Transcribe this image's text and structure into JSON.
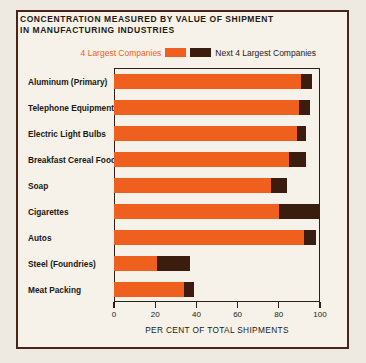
{
  "title": {
    "line1": "CONCENTRATION MEASURED BY VALUE OF SHIPMENT",
    "line2": "IN MANUFACTURING INDUSTRIES"
  },
  "legend": {
    "first_label": "4 Largest Companies",
    "second_label": "Next 4 Largest Companies",
    "first_color": "#ef5f1e",
    "second_color": "#3b1d10"
  },
  "colors": {
    "background": "#f6f2e9",
    "page": "#efeae1",
    "frame": "#4a2418",
    "axis": "#2b2119",
    "text": "#231a14"
  },
  "chart_data": {
    "type": "bar",
    "orientation": "horizontal",
    "stacked": true,
    "title": "CONCENTRATION MEASURED BY VALUE OF SHIPMENT IN MANUFACTURING INDUSTRIES",
    "xlabel": "PER CENT OF TOTAL SHIPMENTS",
    "ylabel": "",
    "xlim": [
      0,
      100
    ],
    "xticks": [
      0,
      20,
      40,
      60,
      80,
      100
    ],
    "xticklabels": [
      "0",
      "20",
      "40",
      "60",
      "80",
      "100"
    ],
    "grid": false,
    "legend_position": "top-right",
    "categories": [
      "Aluminum (Primary)",
      "Telephone Equipment",
      "Electric Light Bulbs",
      "Breakfast Cereal Foods",
      "Soap",
      "Cigarettes",
      "Autos",
      "Steel (Foundries)",
      "Meat Packing"
    ],
    "series": [
      {
        "name": "4 Largest Companies",
        "color": "#ef5f1e",
        "values": [
          91,
          90,
          89,
          85,
          76,
          80,
          92,
          21,
          34
        ]
      },
      {
        "name": "Next 4 Largest Companies",
        "color": "#3b1d10",
        "values": [
          5,
          5,
          4,
          8,
          8,
          20,
          6,
          16,
          5
        ]
      }
    ],
    "totals": [
      96,
      95,
      93,
      93,
      84,
      100,
      98,
      37,
      39
    ]
  }
}
